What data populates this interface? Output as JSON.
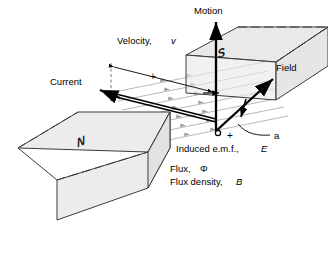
{
  "figure": {
    "labels": {
      "motion": "Motion",
      "velocity_prefix": "Velocity, ",
      "velocity_symbol": "v",
      "current": "Current",
      "field": "Field",
      "induced_emf_prefix": "Induced e.m.f., ",
      "induced_emf_symbol": "E",
      "flux_prefix": "Flux, ",
      "flux_symbol": "Φ",
      "flux_density_prefix": "Flux density, ",
      "flux_density_symbol": "B",
      "dimension_label": "a",
      "pole_north": "N",
      "pole_south": "S",
      "terminal_positive": "+",
      "terminal_negative": "−",
      "dimension_tick": "+"
    },
    "colors": {
      "background": "#ffffff",
      "stroke": "#000000",
      "magnet_fill": "#ececec",
      "magnet_fill_upper": "#e4e4e4",
      "magnet_edge": "#3c3c3c",
      "flux_line": "#9a9a9a",
      "text": "#000000"
    },
    "elements": {
      "upper_magnet": "south-pole-block",
      "lower_magnet": "north-pole-block",
      "conductor": "moving-conductor-bar",
      "flux_lines_count": 7,
      "arrows": [
        "motion-arrow-up",
        "current-arrow-left",
        "field-arrow-up-right",
        "dimension-arrows",
        "corner-arrow"
      ]
    }
  }
}
